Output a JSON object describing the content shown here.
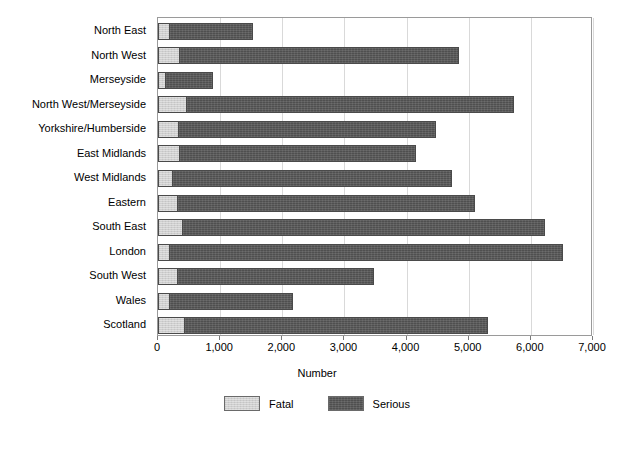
{
  "chart_data": {
    "type": "bar",
    "orientation": "horizontal",
    "stacked": true,
    "title": "",
    "xlabel": "Number",
    "ylabel": "",
    "xlim": [
      0,
      7000
    ],
    "xticks": [
      0,
      1000,
      2000,
      3000,
      4000,
      5000,
      6000,
      7000
    ],
    "xtick_labels": [
      "0",
      "1,000",
      "2,000",
      "3,000",
      "4,000",
      "5,000",
      "6,000",
      "7,000"
    ],
    "grid": true,
    "grid_axis": "x",
    "legend_position": "bottom",
    "categories": [
      "North East",
      "North West",
      "Merseyside",
      "North West/Merseyside",
      "Yorkshire/Humberside",
      "East Midlands",
      "West Midlands",
      "Eastern",
      "South East",
      "London",
      "South West",
      "Wales",
      "Scotland"
    ],
    "series": [
      {
        "name": "Fatal",
        "color": "#cfcfcf",
        "values": [
          175,
          345,
          105,
          450,
          320,
          345,
          230,
          300,
          380,
          180,
          300,
          175,
          420
        ]
      },
      {
        "name": "Serious",
        "color": "#4f4f4f",
        "values": [
          1355,
          4495,
          775,
          5280,
          4160,
          3805,
          4500,
          4800,
          5840,
          6340,
          3180,
          2005,
          4890
        ]
      }
    ],
    "totals": [
      1530,
      4840,
      880,
      5730,
      4480,
      4150,
      4730,
      5100,
      6220,
      6520,
      3480,
      2180,
      5310
    ]
  },
  "legend": {
    "items": [
      {
        "label": "Fatal",
        "color": "#cfcfcf"
      },
      {
        "label": "Serious",
        "color": "#4f4f4f"
      }
    ]
  }
}
